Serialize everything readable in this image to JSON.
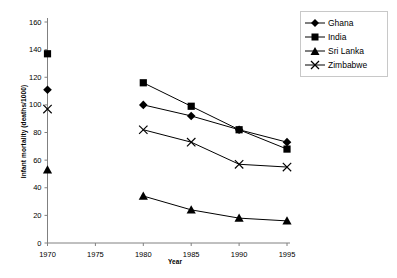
{
  "chart_data": {
    "type": "line",
    "title": "",
    "subtitle": "",
    "xlabel": "Year",
    "ylabel": "Infant mortality (deaths/1000)",
    "x": [
      1970,
      1980,
      1985,
      1990,
      1995
    ],
    "xlim": [
      1970,
      1995
    ],
    "ylim": [
      0,
      160
    ],
    "x_ticks": [
      "1970",
      "1975",
      "1980",
      "1985",
      "1990",
      "1995"
    ],
    "x_tick_values": [
      1970,
      1975,
      1980,
      1985,
      1990,
      1995
    ],
    "y_ticks": [
      "0",
      "20",
      "40",
      "60",
      "80",
      "100",
      "120",
      "140",
      "160"
    ],
    "y_tick_values": [
      0,
      20,
      40,
      60,
      80,
      100,
      120,
      140,
      160
    ],
    "grid": false,
    "legend_position": "top-right",
    "series": [
      {
        "name": "Ghana",
        "marker": "diamond",
        "color": "#000000",
        "x": [
          1970,
          1980,
          1985,
          1990,
          1995
        ],
        "values": [
          111,
          100,
          92,
          82,
          73
        ],
        "connected_from": 1980
      },
      {
        "name": "India",
        "marker": "square",
        "color": "#000000",
        "x": [
          1970,
          1980,
          1985,
          1990,
          1995
        ],
        "values": [
          137,
          116,
          99,
          82,
          68
        ],
        "connected_from": 1980
      },
      {
        "name": "Sri Lanka",
        "marker": "triangle",
        "color": "#000000",
        "x": [
          1970,
          1980,
          1985,
          1990,
          1995
        ],
        "values": [
          53,
          34,
          24,
          18,
          16
        ],
        "connected_from": 1980
      },
      {
        "name": "Zimbabwe",
        "marker": "cross",
        "color": "#000000",
        "x": [
          1970,
          1980,
          1985,
          1990,
          1995
        ],
        "values": [
          97,
          82,
          73,
          57,
          55
        ],
        "connected_from": 1980
      }
    ]
  },
  "legend": {
    "entries": [
      {
        "label": "Ghana",
        "marker": "diamond"
      },
      {
        "label": "India",
        "marker": "square"
      },
      {
        "label": "Sri Lanka",
        "marker": "triangle"
      },
      {
        "label": "Zimbabwe",
        "marker": "cross"
      }
    ]
  },
  "colors": {
    "series": "#000000",
    "axis": "#808080",
    "tick_label": "#000000",
    "legend_border": "#c8c8c8",
    "background": "#ffffff"
  }
}
